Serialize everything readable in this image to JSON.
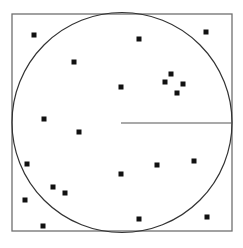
{
  "diagram": {
    "square": {
      "x": 12,
      "y": 14,
      "width": 220,
      "height": 217,
      "stroke": "#6f6f6f"
    },
    "circle": {
      "cx": 122,
      "cy": 122.5,
      "r": 110,
      "stroke": "#333333"
    },
    "radius_line": {
      "x1": 121,
      "y1": 123,
      "x2": 232,
      "y2": 123,
      "stroke": "#555555"
    },
    "point_color": "#111111",
    "point_size": 5,
    "points": [
      [
        34,
        35
      ],
      [
        74,
        62
      ],
      [
        139,
        39
      ],
      [
        206,
        32
      ],
      [
        121,
        87
      ],
      [
        165,
        82
      ],
      [
        171,
        74
      ],
      [
        183,
        84
      ],
      [
        177,
        93
      ],
      [
        44,
        119
      ],
      [
        79,
        132
      ],
      [
        27,
        164
      ],
      [
        53,
        187
      ],
      [
        65,
        193
      ],
      [
        25,
        200
      ],
      [
        43,
        226
      ],
      [
        121,
        174
      ],
      [
        157,
        165
      ],
      [
        194,
        161
      ],
      [
        139,
        219
      ],
      [
        207,
        217
      ]
    ]
  }
}
